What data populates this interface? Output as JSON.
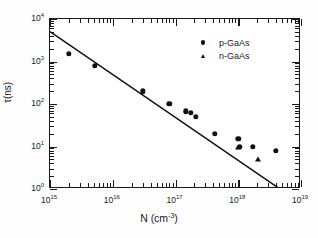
{
  "chart_data": {
    "type": "scatter",
    "title": "",
    "xlabel": "N (cm-3)",
    "xlabel_base": "N (cm",
    "xlabel_exp": "-3",
    "xlabel_tail": ")",
    "ylabel": "τ(ns)",
    "xscale": "log",
    "yscale": "log",
    "xlim": [
      1000000000000000.0,
      1e+19
    ],
    "ylim": [
      1,
      10000
    ],
    "grid": false,
    "legend_position": "upper right",
    "xticks": [
      {
        "value": 1000000000000000.0,
        "label_base": "10",
        "label_exp": "15"
      },
      {
        "value": 1e+16,
        "label_base": "10",
        "label_exp": "16"
      },
      {
        "value": 1e+17,
        "label_base": "10",
        "label_exp": "17"
      },
      {
        "value": 1e+18,
        "label_base": "10",
        "label_exp": "18"
      },
      {
        "value": 1e+19,
        "label_base": "10",
        "label_exp": "19"
      }
    ],
    "yticks": [
      {
        "value": 1,
        "label_base": "10",
        "label_exp": "0"
      },
      {
        "value": 10,
        "label_base": "10",
        "label_exp": "1"
      },
      {
        "value": 100,
        "label_base": "10",
        "label_exp": "2"
      },
      {
        "value": 1000,
        "label_base": "10",
        "label_exp": "3"
      },
      {
        "value": 10000,
        "label_base": "10",
        "label_exp": "4"
      }
    ],
    "series": [
      {
        "name": "p-GaAs",
        "marker": "circle",
        "color": "#101010",
        "points": [
          {
            "x": 2000000000000000.0,
            "y": 1500
          },
          {
            "x": 5200000000000000.0,
            "y": 800
          },
          {
            "x": 3e+16,
            "y": 200
          },
          {
            "x": 8e+16,
            "y": 100
          },
          {
            "x": 1.45e+17,
            "y": 67
          },
          {
            "x": 1.75e+17,
            "y": 63
          },
          {
            "x": 2.1e+17,
            "y": 50
          },
          {
            "x": 4.2e+17,
            "y": 20
          },
          {
            "x": 1e+18,
            "y": 15
          },
          {
            "x": 1.05e+18,
            "y": 10
          },
          {
            "x": 1.7e+18,
            "y": 10
          },
          {
            "x": 4e+18,
            "y": 8
          }
        ]
      },
      {
        "name": "n-GaAs",
        "marker": "triangle",
        "color": "#101010",
        "points": [
          {
            "x": 1e+18,
            "y": 10
          },
          {
            "x": 2.05e+18,
            "y": 5
          }
        ]
      }
    ],
    "trend_line": {
      "name": "fit-line",
      "color": "#101010",
      "x_start": 1000000000000000.0,
      "y_start": 5000,
      "x_end": 4.6e+18,
      "y_end": 1.0
    }
  }
}
